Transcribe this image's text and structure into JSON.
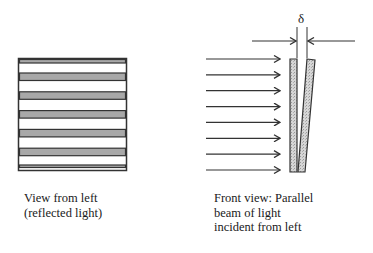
{
  "diagram": {
    "left_view": {
      "caption_lines": [
        "View from left",
        "(reflected light)"
      ],
      "fringe_count": 5,
      "fringe_color": "#a8a8a8"
    },
    "front_view": {
      "caption_lines": [
        "Front view: Parallel",
        "beam of light",
        "incident from left"
      ],
      "gap_symbol": "δ",
      "incident_ray_count": 8,
      "plate_fill": "#d0d0d0"
    },
    "stroke_color": "#333333"
  }
}
